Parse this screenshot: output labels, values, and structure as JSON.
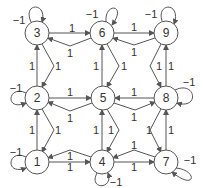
{
  "diagram": {
    "type": "directed-graph",
    "nodes": [
      {
        "id": "1",
        "x": 37,
        "y": 162
      },
      {
        "id": "2",
        "x": 37,
        "y": 98
      },
      {
        "id": "3",
        "x": 37,
        "y": 33
      },
      {
        "id": "4",
        "x": 102,
        "y": 162
      },
      {
        "id": "5",
        "x": 103,
        "y": 98
      },
      {
        "id": "6",
        "x": 102,
        "y": 33
      },
      {
        "id": "7",
        "x": 166,
        "y": 162
      },
      {
        "id": "8",
        "x": 166,
        "y": 98
      },
      {
        "id": "9",
        "x": 166,
        "y": 33
      }
    ],
    "edges": [
      {
        "from": "1",
        "to": "4",
        "weight": "1"
      },
      {
        "from": "4",
        "to": "1",
        "weight": "1"
      },
      {
        "from": "4",
        "to": "7",
        "weight": "1"
      },
      {
        "from": "7",
        "to": "4",
        "weight": "1"
      },
      {
        "from": "2",
        "to": "5",
        "weight": "1"
      },
      {
        "from": "5",
        "to": "2",
        "weight": "1"
      },
      {
        "from": "8",
        "to": "5",
        "weight": "1"
      },
      {
        "from": "5",
        "to": "8",
        "weight": "1"
      },
      {
        "from": "3",
        "to": "6",
        "weight": "1"
      },
      {
        "from": "6",
        "to": "3",
        "weight": "1"
      },
      {
        "from": "6",
        "to": "9",
        "weight": "1"
      },
      {
        "from": "9",
        "to": "6",
        "weight": "1"
      },
      {
        "from": "1",
        "to": "2",
        "weight": "1"
      },
      {
        "from": "2",
        "to": "1",
        "weight": "1"
      },
      {
        "from": "2",
        "to": "3",
        "weight": "1"
      },
      {
        "from": "3",
        "to": "2",
        "weight": "1"
      },
      {
        "from": "4",
        "to": "5",
        "weight": "1"
      },
      {
        "from": "5",
        "to": "4",
        "weight": "1"
      },
      {
        "from": "5",
        "to": "6",
        "weight": "1"
      },
      {
        "from": "6",
        "to": "5",
        "weight": "1"
      },
      {
        "from": "7",
        "to": "8",
        "weight": "1"
      },
      {
        "from": "8",
        "to": "7",
        "weight": "1"
      },
      {
        "from": "8",
        "to": "9",
        "weight": "1"
      },
      {
        "from": "9",
        "to": "8",
        "weight": "1"
      }
    ],
    "self_loops": [
      {
        "node": "1",
        "weight": "−1",
        "side": "left"
      },
      {
        "node": "2",
        "weight": "−1",
        "side": "left"
      },
      {
        "node": "3",
        "weight": "−1",
        "side": "top"
      },
      {
        "node": "6",
        "weight": "−1",
        "side": "top"
      },
      {
        "node": "9",
        "weight": "−1",
        "side": "top"
      },
      {
        "node": "8",
        "weight": "−1",
        "side": "right"
      },
      {
        "node": "7",
        "weight": "−1",
        "side": "bottom-right"
      },
      {
        "node": "4",
        "weight": "−1",
        "side": "bottom"
      }
    ]
  }
}
